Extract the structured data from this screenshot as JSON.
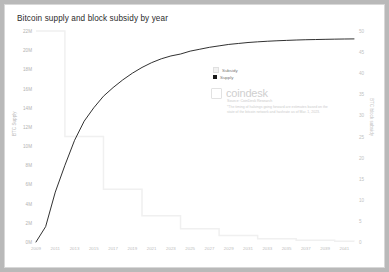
{
  "chart_title": "Bitcoin supply and block subsidy by year",
  "legend": {
    "items": [
      {
        "label": "Subsidy",
        "color": "#f2f2f2"
      },
      {
        "label": "Supply",
        "color": "#1a1a1a"
      }
    ]
  },
  "branding": {
    "logo_icon": "coindesk-square-icon",
    "name": "coindesk",
    "source": "Source: CoinDesk Research",
    "footnote": "*The timing of halvings going forward are estimates based on the state of the bitcoin network and hashrate as of Mar. 1, 2023."
  },
  "chart_data": {
    "type": "line",
    "title": "Bitcoin supply and block subsidy by year",
    "xlabel": "",
    "ylabel": "BTC Supply",
    "y2label": "BTC block subsidy",
    "xlim": [
      2009,
      2042
    ],
    "ylim": [
      0,
      22000000
    ],
    "y2lim": [
      0,
      50
    ],
    "grid": false,
    "legend_position": "inside-top-right",
    "x_ticks": [
      2009,
      2011,
      2013,
      2015,
      2017,
      2019,
      2021,
      2023,
      2025,
      2027,
      2029,
      2031,
      2033,
      2035,
      2037,
      2039,
      2041
    ],
    "y_ticks": [
      "0M",
      "2M",
      "4M",
      "6M",
      "8M",
      "10M",
      "12M",
      "14M",
      "16M",
      "18M",
      "20M",
      "22M"
    ],
    "y_tick_values": [
      0,
      2000000,
      4000000,
      6000000,
      8000000,
      10000000,
      12000000,
      14000000,
      16000000,
      18000000,
      20000000,
      22000000
    ],
    "y2_ticks": [
      "0",
      "5",
      "10",
      "15",
      "20",
      "25",
      "30",
      "35",
      "40",
      "45",
      "50"
    ],
    "y2_tick_values": [
      0,
      5,
      10,
      15,
      20,
      25,
      30,
      35,
      40,
      45,
      50
    ],
    "series": [
      {
        "name": "Supply",
        "axis": "left",
        "type": "line",
        "color": "#1a1a1a",
        "x": [
          2009,
          2010,
          2011,
          2012,
          2013,
          2014,
          2015,
          2016,
          2017,
          2018,
          2019,
          2020,
          2021,
          2022,
          2023,
          2024,
          2025,
          2026,
          2027,
          2028,
          2029,
          2030,
          2031,
          2032,
          2033,
          2034,
          2035,
          2036,
          2037,
          2038,
          2039,
          2040,
          2041,
          2042
        ],
        "values": [
          0,
          1600000,
          5200000,
          8000000,
          10600000,
          12600000,
          14000000,
          15200000,
          16100000,
          16900000,
          17600000,
          18200000,
          18700000,
          19100000,
          19400000,
          19600000,
          19900000,
          20100000,
          20300000,
          20450000,
          20600000,
          20700000,
          20800000,
          20870000,
          20930000,
          20980000,
          21020000,
          21060000,
          21090000,
          21110000,
          21130000,
          21150000,
          21165000,
          21175000
        ]
      },
      {
        "name": "Subsidy",
        "axis": "right",
        "type": "step",
        "color": "#f0f0f0",
        "x": [
          2009,
          2012,
          2016,
          2020,
          2024,
          2028,
          2032,
          2036,
          2040,
          2042
        ],
        "values": [
          50,
          25,
          12.5,
          6.25,
          3.125,
          1.5625,
          0.78125,
          0.390625,
          0.1953125,
          0.09765625
        ]
      }
    ]
  }
}
